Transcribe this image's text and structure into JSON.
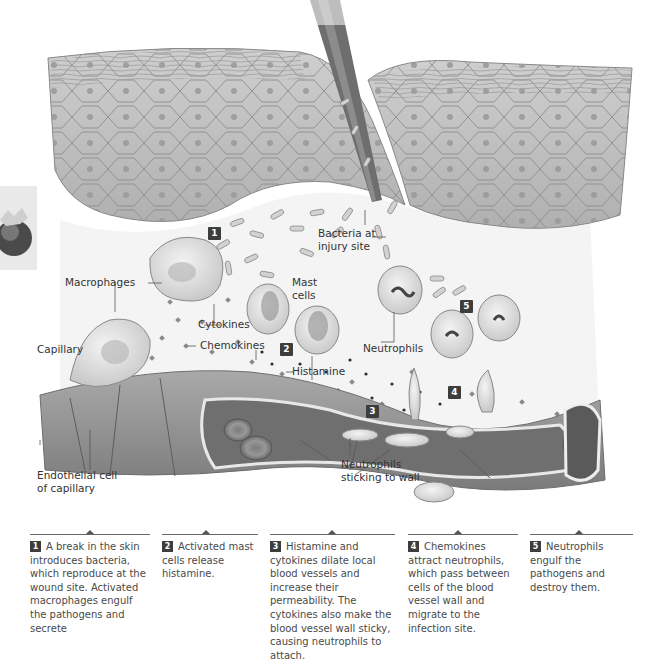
{
  "figure": {
    "labels": {
      "bacteria": [
        "Bacteria at",
        "injury site"
      ],
      "macrophages": "Macrophages",
      "mast_cells": [
        "Mast",
        "cells"
      ],
      "cytokines": "Cytokines",
      "chemokines": "Chemokines",
      "capillary": "Capillary",
      "histamine": "Histamine",
      "neutrophils": "Neutrophils",
      "neutrophils_sticking": [
        "Neutrophils",
        "sticking to wall"
      ],
      "endothelial": [
        "Endothelial cell",
        "of capillary"
      ]
    },
    "step_badges": [
      "1",
      "2",
      "3",
      "4",
      "5"
    ],
    "colors": {
      "skin": "#b9b9b9",
      "skin_edge": "#8a8a8a",
      "tissue": "#f3f3f3",
      "vessel": "#8f8f8f",
      "badge": "#3d3d3d"
    }
  },
  "captions": [
    {
      "num": "1",
      "text": "A break in the skin introduces bacteria, which reproduce at the wound site. Activated macrophages engulf the pathogens and secrete"
    },
    {
      "num": "2",
      "text": "Activated mast cells release histamine."
    },
    {
      "num": "3",
      "text": "Histamine and cytokines dilate local blood vessels and increase their permeability. The cytokines also make the blood vessel wall sticky, causing neutrophils to attach."
    },
    {
      "num": "4",
      "text": "Chemokines attract neutrophils, which pass between cells of the blood vessel wall and migrate to the infection site."
    },
    {
      "num": "5",
      "text": "Neutrophils engulf the pathogens and destroy them."
    }
  ]
}
